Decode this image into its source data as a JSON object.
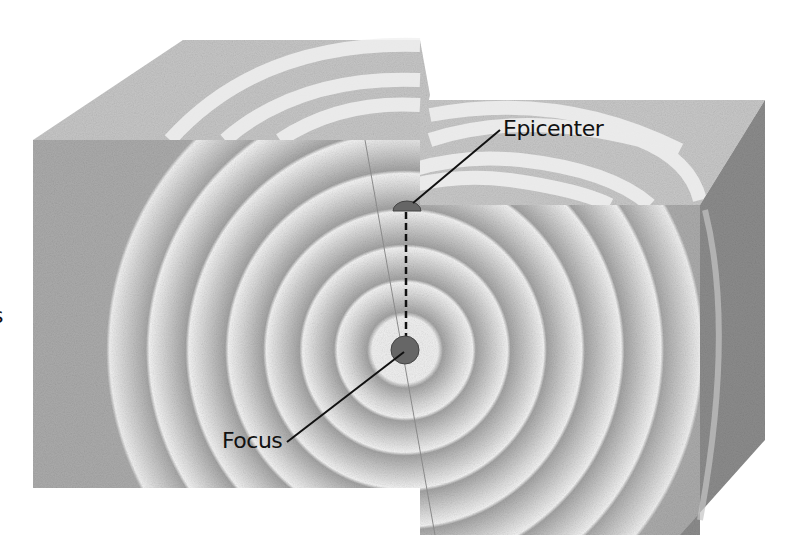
{
  "diagram": {
    "labels": {
      "epicenter": "Epicenter",
      "focus": "Focus",
      "edge_fragment": "s"
    },
    "elements": {
      "focus_point": {
        "cx": 405,
        "cy": 350,
        "r": 14
      },
      "epicenter_point": {
        "cx": 407,
        "cy": 210
      },
      "wave_ring_count": 8,
      "fault_plane": true,
      "dashed_link": "vertical line from epicenter to focus"
    },
    "colors": {
      "block_face": "#a9a9a9",
      "block_top": "#c9c9c9",
      "block_side_dark": "#8a8a8a",
      "wave_light": "#f2f2f2",
      "focus_fill": "#666666",
      "line": "#111111",
      "background": "#ffffff"
    }
  }
}
